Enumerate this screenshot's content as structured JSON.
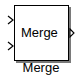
{
  "block": {
    "type": "Merge",
    "icon_text": "Merge",
    "name": "Merge",
    "input_ports": [
      {
        "index": 1,
        "icon": "input-port-chevron-icon"
      },
      {
        "index": 2,
        "icon": "input-port-chevron-icon"
      }
    ],
    "output_ports": [
      {
        "index": 1,
        "icon": "output-port-triangle-icon"
      }
    ],
    "colors": {
      "border": "#000000",
      "shadow": "#7a7a7a",
      "background": "#ffffff"
    }
  }
}
